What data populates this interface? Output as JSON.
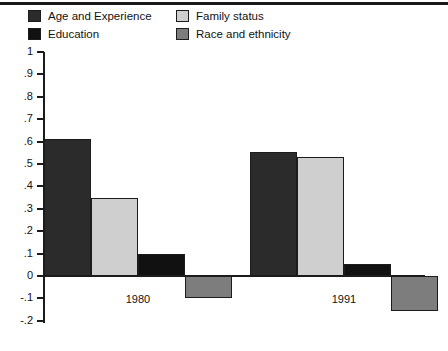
{
  "chart_data": {
    "type": "bar",
    "title": "",
    "subtitle": "",
    "xlabel": "",
    "ylabel": "",
    "categories": [
      "1980",
      "1991"
    ],
    "ylim": [
      -0.2,
      1.0
    ],
    "yticks": [
      1,
      0.9,
      0.8,
      0.7,
      0.6,
      0.5,
      0.4,
      0.3,
      0.2,
      0.1,
      0,
      -0.1,
      -0.2
    ],
    "ytick_labels": [
      "1",
      ".9",
      ".8",
      ".7",
      ".6",
      ".5",
      ".4",
      ".3",
      ".2",
      ".1",
      "0",
      "-.1",
      "-.2"
    ],
    "grid": false,
    "legend_position": "top",
    "series": [
      {
        "name": "Age and Experience",
        "color": "#2b2b2b",
        "values": [
          0.61,
          0.555
        ]
      },
      {
        "name": "Education",
        "color": "#111111",
        "values": [
          0.1,
          0.055
        ]
      },
      {
        "name": "Family status",
        "color": "#cfcfcf",
        "values": [
          0.35,
          0.53
        ]
      },
      {
        "name": "Race and ethnicity",
        "color": "#7d7d7d",
        "values": [
          -0.1,
          -0.155
        ]
      }
    ],
    "bar_order": [
      "Age and Experience",
      "Family status",
      "Education",
      "Race and ethnicity"
    ]
  },
  "legend": {
    "columns": [
      {
        "items": [
          {
            "label": "Age and Experience",
            "swatch_color": "#2b2b2b",
            "swatch_name": "legend-swatch-age-and-experience"
          },
          {
            "label": "Education",
            "swatch_color": "#111111",
            "swatch_name": "legend-swatch-education"
          }
        ]
      },
      {
        "items": [
          {
            "label": "Family status",
            "swatch_color": "#cfcfcf",
            "swatch_name": "legend-swatch-family-status"
          },
          {
            "label": "Race and ethnicity",
            "swatch_color": "#7d7d7d",
            "swatch_name": "legend-swatch-race-and-ethnicity"
          }
        ]
      }
    ]
  },
  "axis": {
    "y_labels": [
      "1",
      ".9",
      ".8",
      ".7",
      ".6",
      ".5",
      ".4",
      ".3",
      ".2",
      ".1",
      "0",
      "-.1",
      "-.2"
    ],
    "x_labels": [
      "1980",
      "1991"
    ]
  },
  "colors": {
    "age_and_experience": "#2b2b2b",
    "education": "#111111",
    "family_status": "#cfcfcf",
    "race_and_ethnicity": "#7d7d7d",
    "axis": "#1b1b1b",
    "background": "#ffffff"
  }
}
